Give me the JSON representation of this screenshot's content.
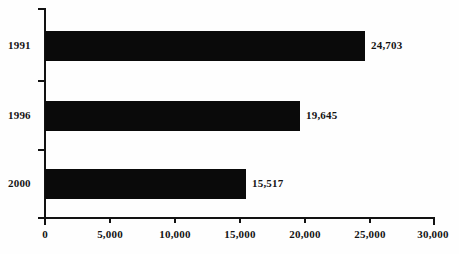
{
  "chart_data": {
    "type": "bar",
    "orientation": "horizontal",
    "title": "",
    "subtitle": "",
    "xlabel": "",
    "ylabel": "",
    "categories": [
      "1991",
      "1996",
      "2000"
    ],
    "values": [
      24703,
      15517,
      19645
    ],
    "value_labels": [
      "24,703",
      "19,645",
      "15,517"
    ],
    "series": [
      {
        "name": "",
        "values": [
          24703,
          19645,
          15517
        ]
      }
    ],
    "bars": [
      {
        "category": "1991",
        "value": 24703,
        "label": "24,703",
        "color": "#0a0a0a"
      },
      {
        "category": "1996",
        "value": 19645,
        "label": "19,645",
        "color": "#0a0a0a"
      },
      {
        "category": "2000",
        "value": 15517,
        "label": "15,517",
        "color": "#0a0a0a"
      }
    ],
    "xlim": [
      0,
      30000
    ],
    "xticks": [
      0,
      5000,
      10000,
      15000,
      20000,
      25000,
      30000
    ],
    "xtick_labels": [
      "0",
      "5,000",
      "10,000",
      "15,000",
      "20,000",
      "25,000",
      "30,000"
    ],
    "grid": false,
    "legend": false,
    "legend_position": "none",
    "bar_color": "#0a0a0a",
    "axis_color": "#121212",
    "background_color": "#fefefe"
  }
}
